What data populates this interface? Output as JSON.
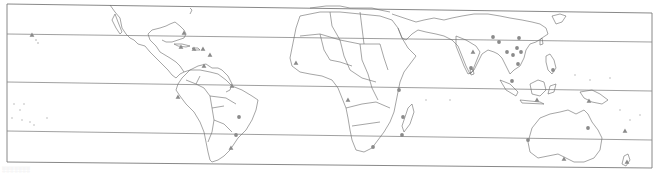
{
  "map": {
    "type": "world-map-outline",
    "projection": "equirectangular, Pacific-centred offset (Americas left, Oceania right)",
    "frame": {
      "x1": 7,
      "y1_left": 4,
      "x2": 652,
      "y1_right": 13,
      "y2_left": 162,
      "y2_right": 168
    },
    "colors": {
      "background": "#ffffff",
      "outline": "#6a6a6a",
      "frame": "#7a7a7a",
      "marker": "#8a8a8a",
      "latline": "#888888"
    },
    "latitude_lines": [
      {
        "label": "tropic-of-cancer",
        "y_left": 34,
        "y_right": 42
      },
      {
        "label": "equator",
        "y_left": 82,
        "y_right": 91
      },
      {
        "label": "tropic-of-capricorn",
        "y_left": 131,
        "y_right": 140
      }
    ],
    "marker_legend": [
      {
        "shape": "triangle",
        "meaning": "site-type-a"
      },
      {
        "shape": "circle",
        "meaning": "site-type-b"
      }
    ],
    "markers": [
      {
        "shape": "triangle",
        "region": "hawaii",
        "x": 32,
        "y": 35
      },
      {
        "shape": "triangle",
        "region": "florida",
        "x": 184,
        "y": 33
      },
      {
        "shape": "triangle",
        "region": "cuba",
        "x": 181,
        "y": 47
      },
      {
        "shape": "triangle",
        "region": "hispaniola",
        "x": 194,
        "y": 49
      },
      {
        "shape": "triangle",
        "region": "puerto-rico",
        "x": 203,
        "y": 49
      },
      {
        "shape": "triangle",
        "region": "lesser-antilles",
        "x": 210,
        "y": 55
      },
      {
        "shape": "triangle",
        "region": "venezuela",
        "x": 204,
        "y": 66
      },
      {
        "shape": "triangle",
        "region": "guyana",
        "x": 232,
        "y": 86
      },
      {
        "shape": "triangle",
        "region": "peru",
        "x": 178,
        "y": 97
      },
      {
        "shape": "circle",
        "region": "brazil-central",
        "x": 239,
        "y": 117
      },
      {
        "shape": "circle",
        "region": "brazil-rio",
        "x": 236,
        "y": 135
      },
      {
        "shape": "triangle",
        "region": "uruguay",
        "x": 231,
        "y": 148
      },
      {
        "shape": "triangle",
        "region": "sierra-leone",
        "x": 296,
        "y": 63
      },
      {
        "shape": "triangle",
        "region": "angola",
        "x": 348,
        "y": 100
      },
      {
        "shape": "circle",
        "region": "kenya",
        "x": 399,
        "y": 90
      },
      {
        "shape": "circle",
        "region": "mozambique",
        "x": 403,
        "y": 117
      },
      {
        "shape": "circle",
        "region": "madagascar",
        "x": 402,
        "y": 135
      },
      {
        "shape": "circle",
        "region": "south-africa",
        "x": 373,
        "y": 147
      },
      {
        "shape": "triangle",
        "region": "india",
        "x": 473,
        "y": 52
      },
      {
        "shape": "circle",
        "region": "sri-lanka-area",
        "x": 471,
        "y": 68
      },
      {
        "shape": "circle",
        "region": "nepal",
        "x": 493,
        "y": 37
      },
      {
        "shape": "circle",
        "region": "bangladesh",
        "x": 499,
        "y": 42
      },
      {
        "shape": "circle",
        "region": "china-south",
        "x": 519,
        "y": 38
      },
      {
        "shape": "circle",
        "region": "myanmar",
        "x": 507,
        "y": 52
      },
      {
        "shape": "circle",
        "region": "thailand",
        "x": 513,
        "y": 55
      },
      {
        "shape": "circle",
        "region": "vietnam",
        "x": 521,
        "y": 52
      },
      {
        "shape": "circle",
        "region": "laos",
        "x": 517,
        "y": 48
      },
      {
        "shape": "circle",
        "region": "cambodia",
        "x": 518,
        "y": 64
      },
      {
        "shape": "circle",
        "region": "philippines",
        "x": 553,
        "y": 70
      },
      {
        "shape": "circle",
        "region": "malaysia",
        "x": 512,
        "y": 81
      },
      {
        "shape": "triangle",
        "region": "indonesia-java",
        "x": 537,
        "y": 100
      },
      {
        "shape": "triangle",
        "region": "new-guinea",
        "x": 589,
        "y": 101
      },
      {
        "shape": "circle",
        "region": "australia-queensland",
        "x": 588,
        "y": 128
      },
      {
        "shape": "circle",
        "region": "australia-west",
        "x": 528,
        "y": 140
      },
      {
        "shape": "triangle",
        "region": "australia-south",
        "x": 564,
        "y": 159
      },
      {
        "shape": "triangle",
        "region": "fiji-vanuatu",
        "x": 625,
        "y": 131
      },
      {
        "shape": "triangle",
        "region": "new-zealand",
        "x": 627,
        "y": 162
      }
    ]
  },
  "caption": {
    "text": "░░░░░░░"
  }
}
